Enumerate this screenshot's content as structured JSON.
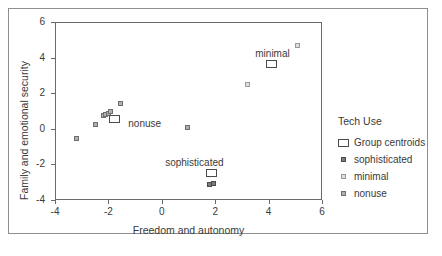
{
  "chart_data": {
    "type": "scatter",
    "title": "",
    "xlabel": "Freedom and autonomy",
    "ylabel": "Family and emotional security",
    "xlim": [
      -4,
      6
    ],
    "ylim": [
      -4,
      6
    ],
    "xticks": [
      -4,
      -2,
      0,
      2,
      4,
      6
    ],
    "yticks": [
      -4,
      -2,
      0,
      2,
      4,
      6
    ],
    "xtick_labels": [
      "-4",
      "-2",
      "0",
      "2",
      "4",
      "6"
    ],
    "ytick_labels": [
      "-4",
      "-2",
      "0",
      "2",
      "4",
      "6"
    ],
    "grid": false,
    "legend_position": "right",
    "legend_title": "Tech Use",
    "legend_entries": [
      {
        "label": "Group centroids",
        "marker": "open-square"
      },
      {
        "label": "sophisticated",
        "marker": "filled-dark-square"
      },
      {
        "label": "minimal",
        "marker": "filled-light-square"
      },
      {
        "label": "nonuse",
        "marker": "filled-mid-square"
      }
    ],
    "series": [
      {
        "name": "sophisticated",
        "marker": "filled-dark-square",
        "points": [
          {
            "x": 1.78,
            "y": -3.12
          },
          {
            "x": 1.92,
            "y": -3.1
          }
        ]
      },
      {
        "name": "minimal",
        "marker": "filled-light-square",
        "points": [
          {
            "x": 3.2,
            "y": 2.5
          },
          {
            "x": 5.1,
            "y": 4.7
          }
        ]
      },
      {
        "name": "nonuse",
        "marker": "filled-mid-square",
        "points": [
          {
            "x": -3.2,
            "y": -0.52
          },
          {
            "x": -2.5,
            "y": 0.22
          },
          {
            "x": -2.2,
            "y": 0.72
          },
          {
            "x": -2.1,
            "y": 0.82
          },
          {
            "x": -2.0,
            "y": 0.88
          },
          {
            "x": -1.92,
            "y": 0.95
          },
          {
            "x": -1.55,
            "y": 1.42
          },
          {
            "x": 0.95,
            "y": 0.05
          }
        ]
      }
    ],
    "centroids": [
      {
        "label": "nonuse",
        "x": -1.78,
        "y": 0.55,
        "label_dx": 14,
        "label_dy": -1
      },
      {
        "label": "sophisticated",
        "x": 1.85,
        "y": -2.5,
        "label_dx": -46,
        "label_dy": -16
      },
      {
        "label": "minimal",
        "x": 4.1,
        "y": 3.62,
        "label_dx": -16,
        "label_dy": -16
      }
    ]
  }
}
